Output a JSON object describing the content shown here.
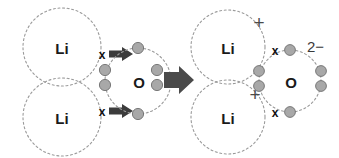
{
  "diagram": {
    "canvas": {
      "width": 339,
      "height": 158,
      "background": "#ffffff"
    },
    "colors": {
      "shell_stroke": "#9a9a9a",
      "electron_fill": "#a8a8a8",
      "electron_stroke": "#6e6e6e",
      "arrow_fill": "#3c3c3c",
      "big_arrow_fill": "#4a4a4a",
      "label_text": "#1a1a1a",
      "charge_text": "#4a4a4a"
    },
    "reactants": {
      "name": "reactants-side",
      "atoms": [
        {
          "id": "li-top-left",
          "symbol": "Li",
          "cx": 62,
          "cy": 47,
          "r": 39,
          "valence_marker": {
            "glyph": "x",
            "x": 102,
            "y": 54
          }
        },
        {
          "id": "li-bottom-left",
          "symbol": "Li",
          "cx": 62,
          "cy": 117,
          "r": 39,
          "valence_marker": {
            "glyph": "x",
            "x": 102,
            "y": 111
          }
        },
        {
          "id": "o-left",
          "symbol": "O",
          "cx": 138,
          "cy": 81,
          "r": 33,
          "electron_count": 6
        }
      ],
      "transfer_arrows": [
        {
          "id": "transfer-arrow-top",
          "x": 111,
          "y": 54,
          "length": 22
        },
        {
          "id": "transfer-arrow-bottom",
          "x": 111,
          "y": 111,
          "length": 22
        }
      ],
      "o_electrons": [
        {
          "id": "e-top",
          "cx": 138,
          "cy": 48
        },
        {
          "id": "e-bottom",
          "cx": 138,
          "cy": 114
        },
        {
          "id": "e-left-upper",
          "cx": 105,
          "cy": 70
        },
        {
          "id": "e-left-lower",
          "cx": 105,
          "cy": 85
        },
        {
          "id": "e-right-upper",
          "cx": 157,
          "cy": 70
        },
        {
          "id": "e-right-lower",
          "cx": 157,
          "cy": 85
        }
      ]
    },
    "reaction_arrow": {
      "id": "reaction-arrow",
      "label": "yields",
      "x": 166,
      "y": 79,
      "length": 26
    },
    "products": {
      "name": "products-side",
      "ions": [
        {
          "id": "li-ion-top-right",
          "symbol": "Li",
          "charge": "+",
          "cx": 228,
          "cy": 47,
          "r": 37,
          "charge_x": 259,
          "charge_y": 21
        },
        {
          "id": "li-ion-bottom-right",
          "symbol": "Li",
          "charge": "+",
          "cx": 228,
          "cy": 117,
          "r": 37,
          "charge_x": 255,
          "charge_y": 93
        },
        {
          "id": "oxide-ion",
          "symbol": "O",
          "charge": "2−",
          "cx": 290,
          "cy": 81,
          "r": 31,
          "charge_x": 312,
          "charge_y": 45
        }
      ],
      "oxide_electrons": [
        {
          "id": "ox-e-top",
          "cx": 290,
          "cy": 50
        },
        {
          "id": "ox-e-bottom",
          "cx": 290,
          "cy": 112
        },
        {
          "id": "ox-e-left-upper",
          "cx": 259,
          "cy": 71
        },
        {
          "id": "ox-e-left-lower",
          "cx": 259,
          "cy": 86
        },
        {
          "id": "ox-e-right-upper",
          "cx": 321,
          "cy": 71
        },
        {
          "id": "ox-e-right-lower",
          "cx": 321,
          "cy": 86
        }
      ],
      "oxide_crosses": [
        {
          "id": "ox-cross-top",
          "glyph": "x",
          "x": 275,
          "y": 50
        },
        {
          "id": "ox-cross-bottom",
          "glyph": "x",
          "x": 275,
          "y": 112
        }
      ]
    }
  }
}
